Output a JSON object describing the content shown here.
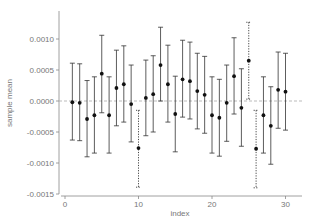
{
  "chart_data": {
    "type": "scatter",
    "subtype": "errorbar",
    "title": "",
    "xlabel": "index",
    "ylabel": "sample mean",
    "xlim": [
      -1,
      32
    ],
    "ylim": [
      -0.0015,
      0.0014
    ],
    "xticks": [
      0,
      10,
      20,
      30
    ],
    "xtick_labels": [
      "0",
      "10",
      "20",
      "30"
    ],
    "yticks": [
      0.001,
      0.0005,
      0.0,
      -0.0005,
      -0.001,
      -0.0015
    ],
    "ytick_labels": [
      "0.0010",
      "0.0005",
      "0.0000",
      "-0.0005",
      "-0.0010",
      "-0.0015"
    ],
    "reference_line": {
      "y": 0.0,
      "style": "dashed"
    },
    "grid": false,
    "legend": null,
    "x": [
      1,
      2,
      3,
      4,
      5,
      6,
      7,
      8,
      9,
      10,
      11,
      12,
      13,
      14,
      15,
      16,
      17,
      18,
      19,
      20,
      21,
      22,
      23,
      24,
      25,
      26,
      27,
      28,
      29,
      30
    ],
    "values": [
      -2e-05,
      -3e-05,
      -0.00029,
      -0.00023,
      0.00044,
      -0.00023,
      0.00021,
      0.00027,
      -5e-05,
      -0.00076,
      5e-05,
      0.00011,
      0.00058,
      0.00027,
      -0.00021,
      0.00035,
      0.00032,
      0.00016,
      0.0001,
      -0.00023,
      -0.00027,
      -3e-05,
      0.0004,
      -0.00011,
      0.00065,
      -0.00077,
      -0.00023,
      -0.0004,
      0.00018,
      0.00015
    ],
    "upper": [
      0.00061,
      0.0006,
      0.00033,
      0.00039,
      0.00106,
      0.00039,
      0.00082,
      0.00089,
      0.00058,
      -0.00015,
      0.00066,
      0.00073,
      0.00119,
      0.0009,
      0.0004,
      0.00098,
      0.00095,
      0.00077,
      0.00072,
      0.00039,
      0.00035,
      0.00058,
      0.00102,
      0.00052,
      0.00127,
      -0.00015,
      0.00039,
      0.00023,
      0.00079,
      0.00077
    ],
    "lower": [
      -0.00063,
      -0.00064,
      -0.0009,
      -0.00084,
      -0.00019,
      -0.00084,
      -0.0004,
      -0.00034,
      -0.00066,
      -0.00139,
      -0.00056,
      -0.0005,
      0.0,
      -0.00034,
      -0.00082,
      -0.00026,
      -0.00029,
      -0.00045,
      -0.00052,
      -0.00084,
      -0.00089,
      -0.00065,
      -0.00021,
      -0.00073,
      3e-05,
      -0.0014,
      -0.00084,
      -0.00102,
      -0.00044,
      -0.00047
    ],
    "dotted_indices": [
      10,
      25,
      26
    ]
  },
  "colors": {
    "point": "#111111",
    "errorbar": "#333333",
    "axis": "#888888",
    "text": "#777777",
    "zero_line": "#aaaaaa"
  }
}
